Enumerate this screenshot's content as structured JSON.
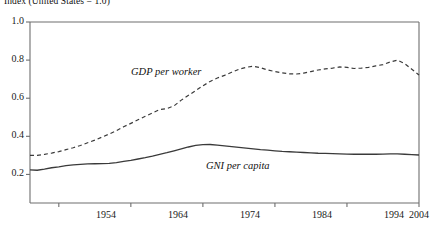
{
  "chart_data": {
    "type": "line",
    "title": "Index (United States = 1.0)",
    "xlabel": "",
    "ylabel": "",
    "xlim": [
      1950,
      2004
    ],
    "ylim": [
      0.05,
      1.0
    ],
    "grid": false,
    "legend_position": "inline-annotation",
    "y_ticks": [
      "1.0",
      "0.8",
      "0.6",
      "0.4",
      "0.2"
    ],
    "y_tick_values": [
      1.0,
      0.8,
      0.6,
      0.4,
      0.2
    ],
    "x_ticks": [
      "1954",
      "1964",
      "1974",
      "1984",
      "1994",
      "2004"
    ],
    "x_tick_values": [
      1954,
      1964,
      1974,
      1984,
      1994,
      2004
    ],
    "annotations": [
      {
        "text": "GDP per worker",
        "x": 1966,
        "y": 0.655
      },
      {
        "text": "GNI per capita",
        "x": 1983,
        "y": 0.275
      }
    ],
    "series": [
      {
        "name": "GDP per worker",
        "style": "dashed",
        "color": "#3a3a3a",
        "x": [
          1950,
          1951,
          1952,
          1953,
          1954,
          1955,
          1956,
          1957,
          1958,
          1959,
          1960,
          1961,
          1962,
          1963,
          1964,
          1965,
          1966,
          1967,
          1968,
          1969,
          1970,
          1971,
          1972,
          1973,
          1974,
          1975,
          1976,
          1977,
          1978,
          1979,
          1980,
          1981,
          1982,
          1983,
          1984,
          1985,
          1986,
          1987,
          1988,
          1989,
          1990,
          1991,
          1992,
          1993,
          1994,
          1995,
          1996,
          1997,
          1998,
          1999,
          2000,
          2001,
          2002,
          2003,
          2004
        ],
        "values": [
          0.3,
          0.3,
          0.305,
          0.312,
          0.32,
          0.33,
          0.34,
          0.352,
          0.366,
          0.38,
          0.396,
          0.412,
          0.43,
          0.45,
          0.468,
          0.487,
          0.505,
          0.523,
          0.54,
          0.545,
          0.56,
          0.59,
          0.615,
          0.64,
          0.665,
          0.688,
          0.706,
          0.72,
          0.736,
          0.752,
          0.762,
          0.768,
          0.76,
          0.748,
          0.74,
          0.733,
          0.728,
          0.727,
          0.732,
          0.74,
          0.748,
          0.754,
          0.758,
          0.764,
          0.762,
          0.756,
          0.758,
          0.762,
          0.77,
          0.776,
          0.79,
          0.8,
          0.782,
          0.752,
          0.722
        ]
      },
      {
        "name": "GNI per capita",
        "style": "solid",
        "color": "#3a3a3a",
        "x": [
          1950,
          1951,
          1952,
          1953,
          1954,
          1955,
          1956,
          1957,
          1958,
          1959,
          1960,
          1961,
          1962,
          1963,
          1964,
          1965,
          1966,
          1967,
          1968,
          1969,
          1970,
          1971,
          1972,
          1973,
          1974,
          1975,
          1976,
          1977,
          1978,
          1979,
          1980,
          1981,
          1982,
          1983,
          1984,
          1985,
          1986,
          1987,
          1988,
          1989,
          1990,
          1991,
          1992,
          1993,
          1994,
          1995,
          1996,
          1997,
          1998,
          1999,
          2000,
          2001,
          2002,
          2003,
          2004
        ],
        "values": [
          0.224,
          0.222,
          0.228,
          0.235,
          0.24,
          0.246,
          0.25,
          0.253,
          0.255,
          0.256,
          0.257,
          0.258,
          0.262,
          0.268,
          0.274,
          0.281,
          0.288,
          0.296,
          0.305,
          0.314,
          0.324,
          0.334,
          0.344,
          0.352,
          0.356,
          0.357,
          0.354,
          0.35,
          0.346,
          0.342,
          0.338,
          0.334,
          0.33,
          0.327,
          0.324,
          0.321,
          0.319,
          0.317,
          0.315,
          0.313,
          0.311,
          0.31,
          0.309,
          0.308,
          0.307,
          0.306,
          0.306,
          0.306,
          0.306,
          0.307,
          0.308,
          0.308,
          0.306,
          0.304,
          0.302
        ]
      }
    ]
  },
  "style": {
    "axis_color": "#6e6e6e",
    "line_color": "#3a3a3a",
    "background": "#ffffff"
  }
}
